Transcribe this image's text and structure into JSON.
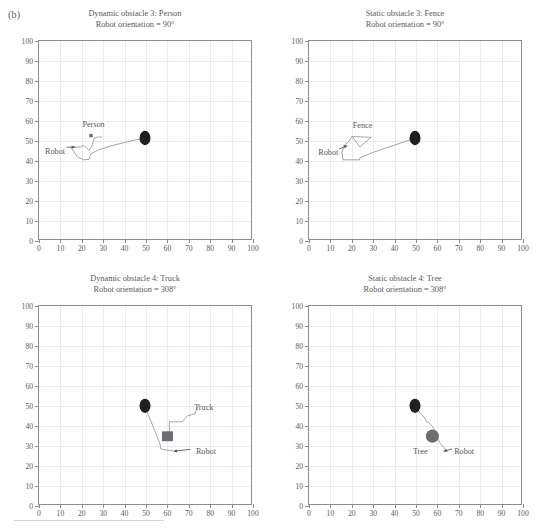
{
  "figure": {
    "panel_label": "(b)",
    "width": 540,
    "height": 529
  },
  "chart_data": [
    {
      "type": "line",
      "id": "dynamic-obstacle-3-person",
      "title": "Dynamic obstacle 3: Person",
      "subtitle": "Robot orientation = 90°",
      "xlabel": "",
      "ylabel": "",
      "xlim": [
        0,
        100
      ],
      "ylim": [
        0,
        100
      ],
      "xticks": [
        0,
        10,
        20,
        30,
        40,
        50,
        60,
        70,
        80,
        90,
        100
      ],
      "yticks": [
        0,
        10,
        20,
        30,
        40,
        50,
        60,
        70,
        80,
        90,
        100
      ],
      "grid": true,
      "legend": "none",
      "annotations": [
        {
          "text": "Person",
          "x": 25.5,
          "y": 58.5
        },
        {
          "text": "Robot",
          "x": 7.5,
          "y": 45.0
        }
      ],
      "markers": [
        {
          "name": "goal-marker",
          "shape": "ellipse",
          "x": 50,
          "y": 51,
          "color": "#231f20",
          "size": 4.2
        },
        {
          "name": "person-marker",
          "shape": "square",
          "x": 24.5,
          "y": 52.2,
          "color": "#6d6e71",
          "size": 1.6
        }
      ],
      "path": [
        [
          50,
          51
        ],
        [
          42,
          49.2
        ],
        [
          34,
          47.0
        ],
        [
          28,
          45.0
        ],
        [
          24.5,
          43.0
        ],
        [
          23.5,
          40.2
        ],
        [
          21.0,
          40.0
        ],
        [
          18.0,
          41.6
        ],
        [
          16.2,
          44.5
        ],
        [
          15.0,
          46.3
        ],
        [
          19.5,
          46.5
        ],
        [
          21.3,
          47.2
        ],
        [
          23.5,
          44.8
        ],
        [
          25.0,
          47.0
        ],
        [
          26.0,
          51.0
        ],
        [
          28.0,
          51.6
        ],
        [
          29.6,
          51.4
        ]
      ],
      "robot_arrow": {
        "x1": 13.0,
        "y1": 46.4,
        "x2": 17.0,
        "y2": 46.4
      }
    },
    {
      "type": "line",
      "id": "static-obstacle-3-fence",
      "title": "Static obstacle 3: Fence",
      "subtitle": "Robot orientation = 90°",
      "xlabel": "",
      "ylabel": "",
      "xlim": [
        0,
        100
      ],
      "ylim": [
        0,
        100
      ],
      "xticks": [
        0,
        10,
        20,
        30,
        40,
        50,
        60,
        70,
        80,
        90,
        100
      ],
      "yticks": [
        0,
        10,
        20,
        30,
        40,
        50,
        60,
        70,
        80,
        90,
        100
      ],
      "grid": true,
      "legend": "none",
      "annotations": [
        {
          "text": "Fence",
          "x": 25.0,
          "y": 58.0
        },
        {
          "text": "Robot",
          "x": 9.0,
          "y": 44.5
        }
      ],
      "markers": [
        {
          "name": "goal-marker",
          "shape": "ellipse",
          "x": 50,
          "y": 51,
          "color": "#231f20",
          "size": 4.2
        }
      ],
      "path": [
        [
          50,
          51
        ],
        [
          42,
          48.0
        ],
        [
          34,
          45.2
        ],
        [
          28,
          42.8
        ],
        [
          24.0,
          41.0
        ],
        [
          23.8,
          40.0
        ],
        [
          20.0,
          40.0
        ],
        [
          16.0,
          40.0
        ],
        [
          15.5,
          44.0
        ],
        [
          16.8,
          47.5
        ],
        [
          19.0,
          49.5
        ],
        [
          20.2,
          51.8
        ],
        [
          24.0,
          51.6
        ],
        [
          28.0,
          51.4
        ],
        [
          29.3,
          51.4
        ],
        [
          24.0,
          46.5
        ],
        [
          20.3,
          51.8
        ]
      ],
      "robot_arrow": {
        "x1": 14.2,
        "y1": 45.4,
        "x2": 18.0,
        "y2": 47.2
      }
    },
    {
      "type": "line",
      "id": "dynamic-obstacle-4-truck",
      "title": "Dynamic obstacle 4: Truck",
      "subtitle": "Robot orientation = 308°",
      "xlabel": "",
      "ylabel": "",
      "xlim": [
        0,
        100
      ],
      "ylim": [
        0,
        100
      ],
      "xticks": [
        0,
        10,
        20,
        30,
        40,
        50,
        60,
        70,
        80,
        90,
        100
      ],
      "yticks": [
        0,
        10,
        20,
        30,
        40,
        50,
        60,
        70,
        80,
        90,
        100
      ],
      "grid": true,
      "legend": "none",
      "annotations": [
        {
          "text": "Truck",
          "x": 77.0,
          "y": 49.5
        },
        {
          "text": "Robot",
          "x": 78.0,
          "y": 27.5
        }
      ],
      "markers": [
        {
          "name": "goal-marker",
          "shape": "ellipse",
          "x": 50,
          "y": 49.6,
          "color": "#231f20",
          "size": 4.2
        },
        {
          "name": "truck-marker",
          "shape": "rect",
          "x": 60.6,
          "y": 34.2,
          "color": "#6d6e71",
          "w": 5.2,
          "h": 5.0
        }
      ],
      "path": [
        [
          50,
          49.6
        ],
        [
          51.5,
          45.0
        ],
        [
          53.5,
          40.0
        ],
        [
          55.5,
          34.5
        ],
        [
          57.0,
          30.5
        ],
        [
          57.5,
          27.8
        ],
        [
          60.0,
          27.2
        ],
        [
          63.0,
          27.0
        ]
      ],
      "truck_path": [
        [
          61.5,
          34.0
        ],
        [
          61.5,
          41.5
        ],
        [
          67.5,
          41.5
        ],
        [
          70.0,
          44.5
        ],
        [
          73.5,
          45.5
        ],
        [
          74.5,
          48.5
        ]
      ],
      "robot_arrow": {
        "x1": 71.5,
        "y1": 27.6,
        "x2": 63.5,
        "y2": 26.6
      }
    },
    {
      "type": "line",
      "id": "static-obstacle-4-tree",
      "title": "Static obstacle 4: Tree",
      "subtitle": "Robot orientation = 308°",
      "xlabel": "",
      "ylabel": "",
      "xlim": [
        0,
        100
      ],
      "ylim": [
        0,
        100
      ],
      "xticks": [
        0,
        10,
        20,
        30,
        40,
        50,
        60,
        70,
        80,
        90,
        100
      ],
      "yticks": [
        0,
        10,
        20,
        30,
        40,
        50,
        60,
        70,
        80,
        90,
        100
      ],
      "grid": true,
      "legend": "none",
      "annotations": [
        {
          "text": "Tree",
          "x": 52.0,
          "y": 27.5
        },
        {
          "text": "Robot",
          "x": 72.5,
          "y": 27.5
        }
      ],
      "markers": [
        {
          "name": "goal-marker",
          "shape": "ellipse",
          "x": 50,
          "y": 49.6,
          "color": "#231f20",
          "size": 4.2
        },
        {
          "name": "tree-marker",
          "shape": "circle",
          "x": 58.2,
          "y": 34.3,
          "color": "#6d6e71",
          "size": 3.1
        }
      ],
      "path": [
        [
          50,
          49.6
        ],
        [
          52.0,
          46.5
        ],
        [
          54.5,
          43.5
        ],
        [
          55.5,
          41.5
        ],
        [
          56.5,
          41.0
        ],
        [
          58.0,
          39.5
        ],
        [
          59.5,
          37.0
        ],
        [
          60.5,
          33.5
        ],
        [
          62.0,
          30.5
        ],
        [
          64.5,
          27.5
        ]
      ],
      "robot_arrow": {
        "x1": 67.5,
        "y1": 27.8,
        "x2": 63.5,
        "y2": 26.6
      }
    }
  ],
  "colors": {
    "axis": "#8c8d8f",
    "grid": "#eceaf0",
    "text": "#58595b",
    "path": "#9a9a9e",
    "marker_dark": "#231f20",
    "marker_gray": "#6d6e71"
  }
}
